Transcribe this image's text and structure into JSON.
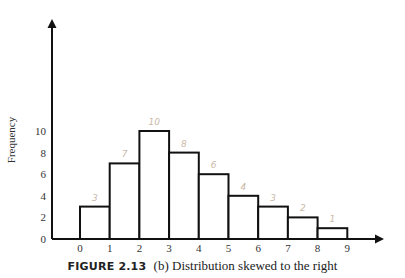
{
  "chart_data": {
    "type": "bar",
    "title": "",
    "xlabel": "",
    "ylabel": "Frequency",
    "x_ticks": [
      "0",
      "1",
      "2",
      "3",
      "4",
      "5",
      "6",
      "7",
      "8",
      "9"
    ],
    "y_ticks": [
      "0",
      "2",
      "4",
      "6",
      "8",
      "10"
    ],
    "ylim": [
      0,
      12
    ],
    "bin_edges": [
      0,
      1,
      2,
      3,
      4,
      5,
      6,
      7,
      8,
      9
    ],
    "categories": [
      "0-1",
      "1-2",
      "2-3",
      "3-4",
      "4-5",
      "5-6",
      "6-7",
      "7-8",
      "8-9"
    ],
    "values": [
      3,
      7,
      10,
      8,
      6,
      4,
      3,
      2,
      1
    ],
    "annotations": [
      "3",
      "7",
      "10",
      "8",
      "6",
      "4",
      "3",
      "2",
      "1"
    ],
    "grid": false,
    "legend": null
  },
  "caption": {
    "figure_label": "FIGURE 2.13",
    "text": "(b) Distribution skewed to the right"
  }
}
